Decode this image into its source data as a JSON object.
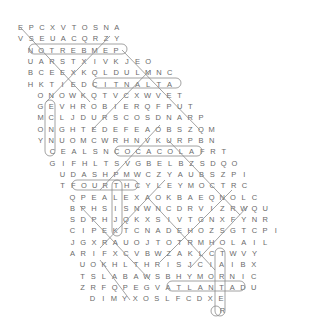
{
  "puzzle": {
    "type": "word-search",
    "cell_w": 10.7,
    "row_h": 11.3,
    "top": 22,
    "rows": [
      {
        "x": 20,
        "letters": "EPCXVTOSNA"
      },
      {
        "x": 20,
        "letters": "VSEUACQRZY"
      },
      {
        "x": 30,
        "letters": "NOTREBMEP"
      },
      {
        "x": 30,
        "letters": "UARSTXIVKJEO"
      },
      {
        "x": 30,
        "letters": "BCEEXKQLDULMNC"
      },
      {
        "x": 30,
        "letters": "HKTIEDCITNALTA"
      },
      {
        "x": 40,
        "letters": "ONOWKQTVCXWVET"
      },
      {
        "x": 40,
        "letters": "GEVHROBIERQFPUT"
      },
      {
        "x": 40,
        "letters": "MCLJDURSCOSDNARP"
      },
      {
        "x": 40,
        "letters": "ONGHTEDEFEAOBSZQM"
      },
      {
        "x": 40,
        "letters": "YNUOMCWRHNVKURPBN"
      },
      {
        "x": 52,
        "letters": "CEALSNCOCACOLAFRT"
      },
      {
        "x": 52,
        "letters": "GIFHLTSVGBELBZSDQO"
      },
      {
        "x": 62,
        "letters": "UDASHPMWCZYAUBSZPI"
      },
      {
        "x": 62,
        "letters": "TFOURTHCYLEYMOCTRC"
      },
      {
        "x": 72,
        "letters": "QPEALEXAOKBAEQNOLC"
      },
      {
        "x": 72,
        "letters": "BPHSISNWNCDRVIZRWQU"
      },
      {
        "x": 72,
        "letters": "SDPHJQKXSIVTGNXFYNR"
      },
      {
        "x": 72,
        "letters": "CIPEKTCNADEHOZSGTCPI"
      },
      {
        "x": 72,
        "letters": "JGXRAUOJTOTRMHOLAIL"
      },
      {
        "x": 72,
        "letters": "ARIFXCVBWZAKLCTWVY"
      },
      {
        "x": 82,
        "letters": "UOKHLTHRISJCIAIBX"
      },
      {
        "x": 82,
        "letters": "TSLABAWSBHYMORNIC"
      },
      {
        "x": 82,
        "letters": "ZRFQPEGVATLANTADU"
      },
      {
        "x": 92,
        "letters": "DIMYXOSLFCDXE"
      },
      {
        "x": 222,
        "letters": "R"
      }
    ],
    "found_words_visible": [
      "NOTREBMEP",
      "CITNALTA",
      "COCACOLA",
      "FOURTH",
      "ATLANTA"
    ],
    "highlight_color": "#8a8a8a",
    "letter_color": "#6a6a6a"
  }
}
